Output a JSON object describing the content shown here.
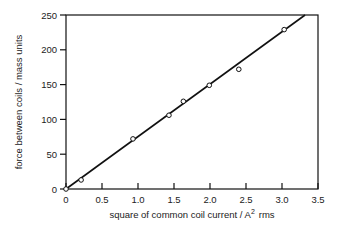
{
  "chart_data": {
    "type": "scatter",
    "title": "",
    "xlabel": "square of common coil current / A",
    "xlabel_superscript": "2",
    "xlabel_suffix": "rms",
    "ylabel": "force between coils / mass units",
    "xlim": [
      0,
      3.5
    ],
    "ylim": [
      0,
      250
    ],
    "x_ticks": [
      0,
      0.5,
      1.0,
      1.5,
      2.0,
      2.5,
      3.0,
      3.5
    ],
    "x_tick_labels": [
      "0",
      "0.5",
      "1.0",
      "1.5",
      "2.0",
      "2.5",
      "3.0",
      "3.5"
    ],
    "y_ticks": [
      0,
      50,
      100,
      150,
      200,
      250
    ],
    "y_tick_labels": [
      "0",
      "50",
      "100",
      "150",
      "200",
      "250"
    ],
    "grid": false,
    "legend": null,
    "series": [
      {
        "name": "measurements",
        "marker": "open-circle",
        "x": [
          0,
          0.21,
          0.93,
          1.43,
          1.63,
          1.99,
          2.4,
          3.03
        ],
        "y": [
          0,
          13,
          72,
          106,
          126,
          149,
          172,
          229
        ]
      },
      {
        "name": "fit line",
        "style": "line",
        "x": [
          0,
          3.32
        ],
        "y": [
          0,
          250
        ]
      }
    ]
  }
}
